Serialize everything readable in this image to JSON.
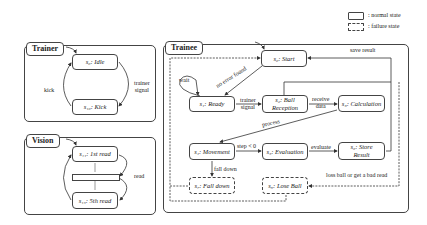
{
  "legend": {
    "normal": ": normal state",
    "failure": ": failure state"
  },
  "panels": {
    "trainer_small": {
      "title": "Trainer",
      "states": {
        "idle": "s₀: Idle",
        "kick": "s₁₀: Kick"
      },
      "transitions": {
        "kick": "kick",
        "trainer_signal": "trainer\nsignal"
      }
    },
    "vision": {
      "title": "Vision",
      "states": {
        "first_read": "s₁₁: 1st read",
        "fifth_read": "s₁₅: 5th read"
      },
      "transitions": {
        "read": "read"
      }
    },
    "trainee": {
      "title": "Trainee",
      "states": {
        "start": "s₀: Start",
        "ready": "s₁: Ready",
        "ball_reception": "s₂: Ball\nReception",
        "calculation": "s₃: Calculation",
        "movement": "s₄: Movement",
        "evaluation": "s₅: Evaluation",
        "store_result": "s₆: Store\nResult",
        "fall_down": "s₇: Fall down",
        "lose_ball": "s₈: Lose Ball"
      },
      "transitions": {
        "wait": "wait",
        "no_error_found": "no error found",
        "trainer_signal": "trainer\nsignal",
        "receive_data": "receive\ndata",
        "process": "process",
        "step_lt_0": "step < 0",
        "evaluate": "evaluate",
        "save_result": "save result",
        "fall_down": "fall down",
        "loss_ball": "loss ball or get a bad read"
      }
    }
  }
}
